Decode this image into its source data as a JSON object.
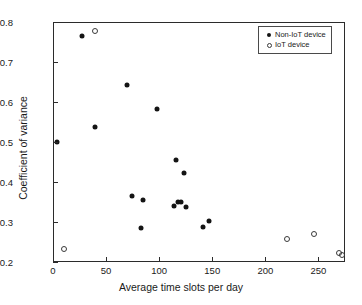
{
  "chart_data": {
    "type": "scatter",
    "title": "",
    "xlabel": "Average time slots per day",
    "ylabel": "Coefficient of variance",
    "xlim": [
      0,
      275
    ],
    "ylim": [
      0.2,
      0.8
    ],
    "xticks": [
      0,
      50,
      100,
      150,
      200,
      250
    ],
    "xticklabels": [
      "0",
      "50",
      "100",
      "150",
      "200",
      "250"
    ],
    "yticks": [
      0.2,
      0.3,
      0.4,
      0.5,
      0.6,
      0.7,
      0.8
    ],
    "yticklabels": [
      "0.2",
      "0.3",
      "0.4",
      "0.5",
      "0.6",
      "0.7",
      "0.8"
    ],
    "grid": false,
    "legend_position": "upper right",
    "series": [
      {
        "name": "Non-IoT device",
        "marker": "filled-circle",
        "color": "#141414",
        "points": [
          [
            3,
            0.502
          ],
          [
            26,
            0.768
          ],
          [
            39,
            0.539
          ],
          [
            69,
            0.646
          ],
          [
            73,
            0.367
          ],
          [
            82,
            0.287
          ],
          [
            84,
            0.358
          ],
          [
            97,
            0.585
          ],
          [
            113,
            0.343
          ],
          [
            115,
            0.458
          ],
          [
            117,
            0.352
          ],
          [
            120,
            0.353
          ],
          [
            122,
            0.424
          ],
          [
            124,
            0.341
          ],
          [
            140,
            0.289
          ],
          [
            146,
            0.304
          ]
        ]
      },
      {
        "name": "IoT device",
        "marker": "open-circle",
        "color": "#3a3a3a",
        "points": [
          [
            9,
            0.236
          ],
          [
            39,
            0.779
          ],
          [
            219,
            0.261
          ],
          [
            245,
            0.272
          ],
          [
            268,
            0.224
          ],
          [
            271,
            0.221
          ]
        ]
      }
    ]
  },
  "legend": {
    "entries": [
      {
        "label": "Non-IoT device",
        "marker": "filled-circle"
      },
      {
        "label": "IoT device",
        "marker": "open-circle"
      }
    ]
  }
}
